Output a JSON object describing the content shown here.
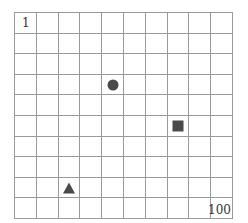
{
  "grid": {
    "rows": 10,
    "cols": 10,
    "start_label": "1",
    "end_label": "100",
    "line_color": "#9a9a9a"
  },
  "shapes": [
    {
      "type": "circle",
      "row": 4,
      "col": 5,
      "cell_number": 35,
      "color": "#4a4a4a"
    },
    {
      "type": "square",
      "row": 6,
      "col": 8,
      "cell_number": 58,
      "color": "#4a4a4a"
    },
    {
      "type": "triangle",
      "row": 9,
      "col": 3,
      "cell_number": 83,
      "color": "#4a4a4a"
    }
  ]
}
